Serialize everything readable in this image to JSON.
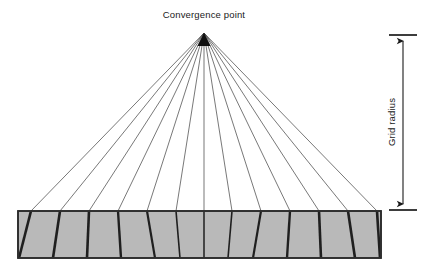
{
  "figure": {
    "title_label": "Convergence point",
    "radius_label": "Grid radius",
    "background_color": "#ffffff"
  },
  "convergence_point": {
    "x": 204,
    "y": 33,
    "marker": "filled-triangle"
  },
  "grid_box": {
    "left": 18,
    "top": 211,
    "right": 381,
    "bottom": 258,
    "fill_color": "#b9b9b9",
    "stroke_color": "#2b2b2b",
    "stroke_width": 1.6
  },
  "radiating_lines": {
    "count": 13,
    "stroke_color": "#3d3d3d",
    "thin_stroke_width": 0.7,
    "thick_stroke_width": 2.6,
    "top_x_values": [
      31,
      60,
      89,
      118,
      147,
      176,
      204,
      232,
      261,
      290,
      319,
      348,
      377
    ],
    "bottom_x_values": [
      19,
      53,
      87,
      121,
      155,
      180,
      204,
      228,
      253,
      287,
      321,
      355,
      380
    ]
  },
  "dimension_arrow": {
    "x": 403,
    "top_y": 35,
    "bottom_y": 210,
    "tick_half_width": 14,
    "stroke_color": "#1a1a1a",
    "label": "Grid radius",
    "label_x": 395,
    "label_y": 122
  }
}
